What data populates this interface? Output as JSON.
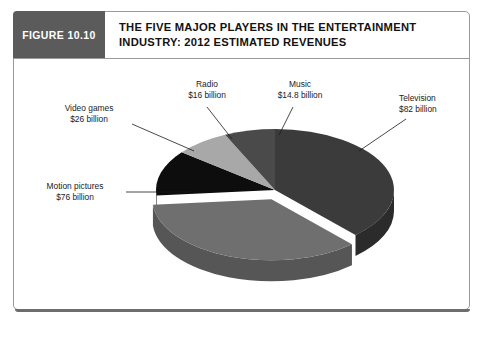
{
  "figure": {
    "tag": "FIGURE 10.10",
    "title_line1": "THE FIVE MAJOR PLAYERS IN THE ENTERTAINMENT",
    "title_line2": "INDUSTRY: 2012 ESTIMATED REVENUES"
  },
  "chart_data": {
    "type": "pie",
    "title": "THE FIVE MAJOR PLAYERS IN THE ENTERTAINMENT INDUSTRY: 2012 ESTIMATED REVENUES",
    "unit": "billion US dollars",
    "total": 214.8,
    "legend_position": "callout-labels",
    "three_d": true,
    "categories": [
      "Television",
      "Motion pictures",
      "Video games",
      "Radio",
      "Music"
    ],
    "values": [
      82,
      76,
      26,
      16,
      14.8
    ],
    "labels": [
      {
        "name": "Television",
        "value_text": "$82 billion",
        "name_text": "Television",
        "color": "#3b3b3b",
        "side_color": "#2b2b2b",
        "percent": 38.2,
        "exploded": false
      },
      {
        "name": "Motion pictures",
        "value_text": "$76 billion",
        "name_text": "Motion pictures",
        "color": "#6f6f6f",
        "side_color": "#565656",
        "percent": 35.4,
        "exploded": true
      },
      {
        "name": "Video games",
        "value_text": "$26 billion",
        "name_text": "Video games",
        "color": "#0d0d0d",
        "side_color": "#070707",
        "percent": 12.1,
        "exploded": false
      },
      {
        "name": "Radio",
        "value_text": "$16 billion",
        "name_text": "Radio",
        "color": "#a8a8a8",
        "side_color": "#8a8a8a",
        "percent": 7.4,
        "exploded": false
      },
      {
        "name": "Music",
        "value_text": "$14.8 billion",
        "name_text": "Music",
        "color": "#4a4a4a",
        "side_color": "#3a3a3a",
        "percent": 6.9,
        "exploded": false
      }
    ]
  },
  "callouts": {
    "radio": {
      "line1": "Radio",
      "line2": "$16 billion"
    },
    "music": {
      "line1": "Music",
      "line2": "$14.8 billion"
    },
    "television": {
      "line1": "Television",
      "line2": "$82 billion"
    },
    "video_games": {
      "line1": "Video games",
      "line2": "$26 billion"
    },
    "motion_pictures": {
      "line1": "Motion pictures",
      "line2": "$76 billion"
    }
  }
}
